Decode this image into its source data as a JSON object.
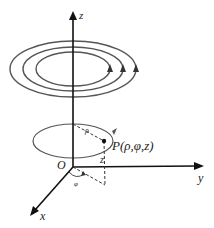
{
  "diagram": {
    "axes": {
      "z_label": "z",
      "y_label": "y",
      "x_label": "x",
      "origin_label": "O"
    },
    "point": {
      "label": "P(ρ,φ,z)",
      "rho_label": "ρ",
      "phi_label": "φ",
      "z_label": "z"
    },
    "rings": {
      "count": 3,
      "direction": "counterclockwise"
    },
    "colors": {
      "axis": "#111111",
      "ring": "#555555",
      "dashed": "#333333"
    }
  }
}
